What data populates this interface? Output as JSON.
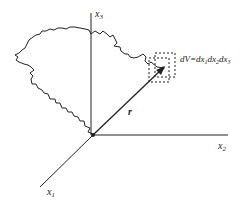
{
  "diagram": {
    "axes": {
      "x1_label": "x",
      "x1_sub": "1",
      "x2_label": "x",
      "x2_sub": "2",
      "x3_label": "x",
      "x3_sub": "3"
    },
    "vector_label": "r",
    "volume_label": "dV=dx",
    "volume_parts": [
      "1",
      "dx",
      "2",
      "dx",
      "3"
    ],
    "colors": {
      "ink": "#222222",
      "background": "#ffffff"
    }
  }
}
